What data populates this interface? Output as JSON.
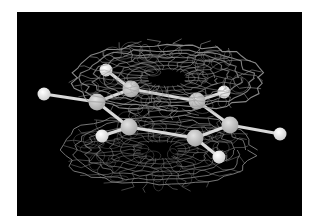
{
  "figure": {
    "background_color": "#000000",
    "page_color": "#ffffff",
    "colors": {
      "carbon": "#c4c4c4",
      "hydrogen": "#eeeeee",
      "bond": "#d8d8d8",
      "mesh_upper": "#a0a0a0",
      "mesh_lower": "#7c7c7c"
    },
    "atoms": [
      {
        "id": "C1",
        "element": "C",
        "x": 97,
        "y": 102
      },
      {
        "id": "C2",
        "element": "C",
        "x": 131,
        "y": 89
      },
      {
        "id": "C3",
        "element": "C",
        "x": 197,
        "y": 101
      },
      {
        "id": "C4",
        "element": "C",
        "x": 230,
        "y": 125
      },
      {
        "id": "C5",
        "element": "C",
        "x": 195,
        "y": 138
      },
      {
        "id": "C6",
        "element": "C",
        "x": 129,
        "y": 127
      },
      {
        "id": "H1",
        "element": "H",
        "x": 44,
        "y": 94
      },
      {
        "id": "H2",
        "element": "H",
        "x": 106,
        "y": 70
      },
      {
        "id": "H3",
        "element": "H",
        "x": 224,
        "y": 92
      },
      {
        "id": "H4",
        "element": "H",
        "x": 280,
        "y": 134
      },
      {
        "id": "H5",
        "element": "H",
        "x": 219,
        "y": 157
      },
      {
        "id": "H6",
        "element": "H",
        "x": 102,
        "y": 136
      }
    ],
    "bonds": [
      [
        "C1",
        "C2"
      ],
      [
        "C2",
        "C3"
      ],
      [
        "C3",
        "C4"
      ],
      [
        "C4",
        "C5"
      ],
      [
        "C5",
        "C6"
      ],
      [
        "C6",
        "C1"
      ],
      [
        "C1",
        "H1"
      ],
      [
        "C2",
        "H2"
      ],
      [
        "C3",
        "H3"
      ],
      [
        "C4",
        "H4"
      ],
      [
        "C5",
        "H5"
      ],
      [
        "C6",
        "H6"
      ]
    ],
    "lobes": [
      {
        "name": "upper-lobe",
        "cx": 167,
        "cy": 78,
        "rx": 95,
        "ry": 40
      },
      {
        "name": "lower-lobe",
        "cx": 159,
        "cy": 150,
        "rx": 94,
        "ry": 42
      }
    ]
  }
}
